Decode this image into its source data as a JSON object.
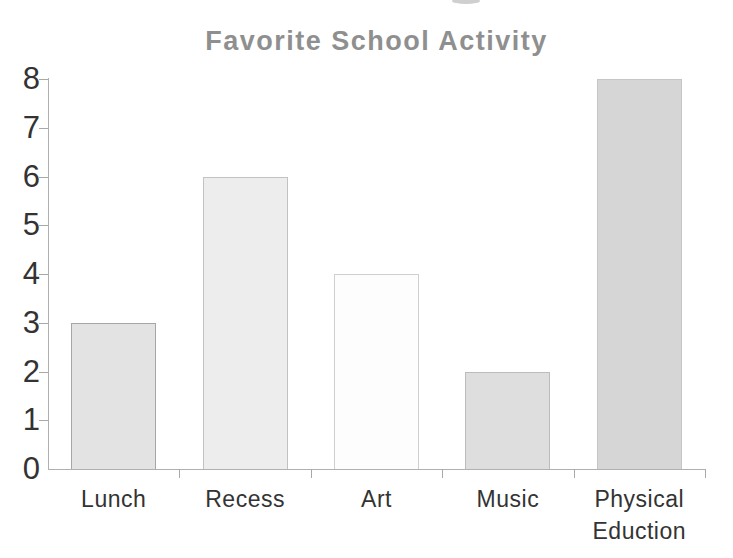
{
  "chart_data": {
    "type": "bar",
    "title": "Favorite School Activity",
    "categories": [
      "Lunch",
      "Recess",
      "Art",
      "Music",
      "Physical Eduction"
    ],
    "category_label_lines": [
      [
        "Lunch"
      ],
      [
        "Recess"
      ],
      [
        "Art"
      ],
      [
        "Music"
      ],
      [
        "Physical",
        "Eduction"
      ]
    ],
    "values": [
      3,
      6,
      4,
      2,
      8
    ],
    "xlabel": "",
    "ylabel": "",
    "ylim": [
      0,
      8
    ],
    "yticks": [
      0,
      1,
      2,
      3,
      4,
      5,
      6,
      7,
      8
    ],
    "grid": false,
    "legend": "none",
    "style": "hand-drawn scanned worksheet",
    "bar_fill_colors": [
      "#e3e3e3",
      "#ededed",
      "#fdfdfd",
      "#dedede",
      "#d6d6d6"
    ],
    "bar_border_colors": [
      "#a6a6a6",
      "#c2c2c2",
      "#cfcfcf",
      "#bcbcbc",
      "#c6c6c6"
    ]
  },
  "colors": {
    "title_text": "#8f8f8f",
    "axis_line": "#b0b0b0",
    "tick_label": "#333333",
    "background": "#ffffff"
  }
}
